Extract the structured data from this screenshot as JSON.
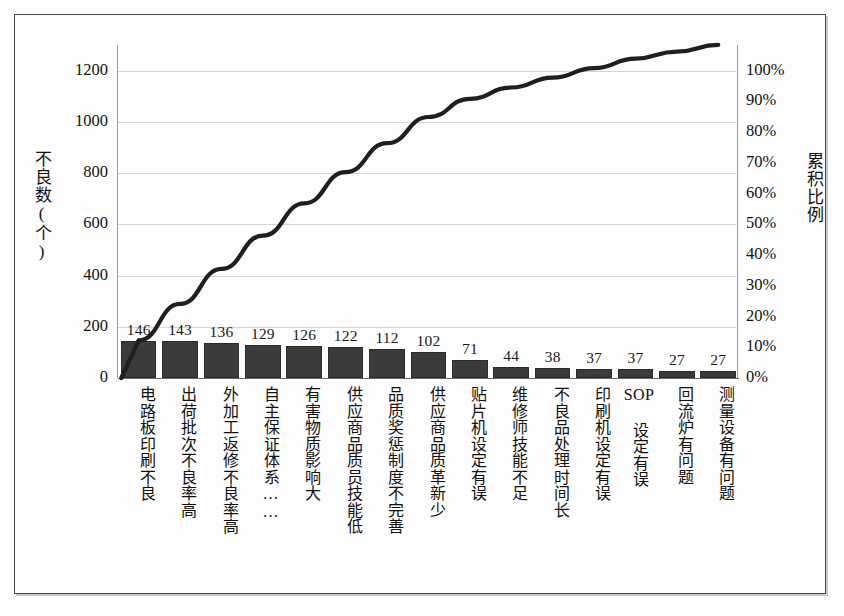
{
  "chart_data": {
    "type": "bar",
    "title": "",
    "subtitle": "",
    "xlabel": "",
    "ylabel": "不良数(个)",
    "y2label": "累积比例",
    "grid": true,
    "legend": "none",
    "ylim": [
      0,
      1300
    ],
    "y2lim": [
      0,
      108.33
    ],
    "yticks": [
      "0",
      "200",
      "400",
      "600",
      "800",
      "1000",
      "1200"
    ],
    "ytick_values": [
      0,
      200,
      400,
      600,
      800,
      1000,
      1200
    ],
    "y2ticks": [
      "0%",
      "10%",
      "20%",
      "30%",
      "40%",
      "50%",
      "60%",
      "70%",
      "80%",
      "90%",
      "100%"
    ],
    "y2tick_values": [
      0,
      10,
      20,
      30,
      40,
      50,
      60,
      70,
      80,
      90,
      100
    ],
    "categories": [
      "电路板印刷不良",
      "出荷批次不良率高",
      "外加工返修不良率高",
      "自主保证体系……",
      "有害物质影响大",
      "供应商品质员技能低",
      "品质奖惩制度不完善",
      "供应商品质革新少",
      "贴片机设定有误",
      "维修师技能不足",
      "不良品处理时间长",
      "印刷机设定有误",
      "SOP 设定有误",
      "回流炉有问题",
      "测量设备有问题"
    ],
    "series": [
      {
        "name": "不良数(个)",
        "type": "bar",
        "color": "#3b3b3b",
        "values": [
          146,
          143,
          136,
          129,
          126,
          122,
          112,
          102,
          71,
          44,
          38,
          37,
          37,
          27,
          27
        ]
      },
      {
        "name": "累积比例",
        "type": "line",
        "color": "#1f1f1f",
        "axis": "right",
        "values": [
          12.2,
          24.1,
          35.5,
          46.3,
          56.8,
          67.0,
          76.4,
          84.9,
          90.8,
          94.5,
          97.7,
          100.8,
          103.9,
          106.2,
          108.4
        ]
      }
    ],
    "bar_value_labels": [
      "146",
      "143",
      "136",
      "129",
      "126",
      "122",
      "112",
      "102",
      "71",
      "44",
      "38",
      "37",
      "37",
      "27",
      "27"
    ],
    "total": 1197
  }
}
